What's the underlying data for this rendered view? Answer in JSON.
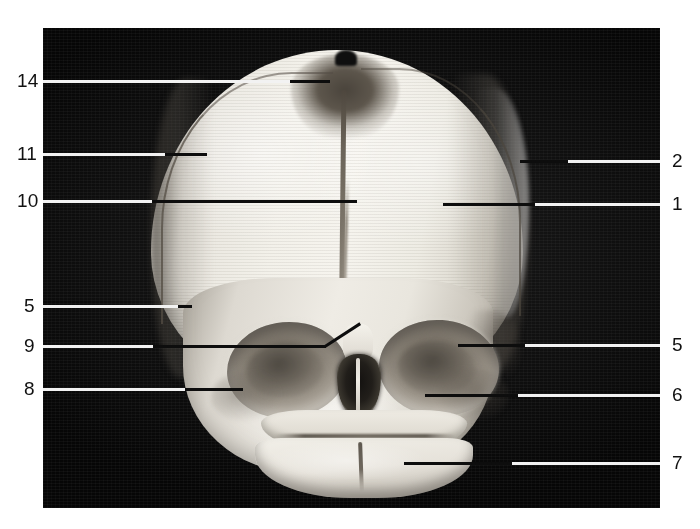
{
  "figure": {
    "plate_background_color": "#0a0a0a",
    "page_background_color": "#ffffff",
    "bone_color": "#f0ede6",
    "label_color": "#111111",
    "leader_line_dark_color": "#0d0d0d",
    "leader_line_light_color": "#f2f2f2"
  },
  "labels": {
    "left": [
      {
        "number": "14",
        "text_x": 17,
        "text_y": 71,
        "line_y": 80,
        "line_start_x": 43,
        "line_end_x": 330
      },
      {
        "number": "11",
        "text_x": 17,
        "text_y": 144,
        "line_y": 153,
        "line_start_x": 43,
        "line_end_x": 207
      },
      {
        "number": "10",
        "text_x": 17,
        "text_y": 191,
        "line_y": 200,
        "line_start_x": 43,
        "line_end_x": 357
      },
      {
        "number": "5",
        "text_x": 24,
        "text_y": 296,
        "line_y": 305,
        "line_start_x": 43,
        "line_end_x": 192
      },
      {
        "number": "9",
        "text_x": 24,
        "text_y": 336,
        "line_y": 345,
        "line_start_x": 43,
        "line_end_x": 326
      },
      {
        "number": "8",
        "text_x": 24,
        "text_y": 379,
        "line_y": 388,
        "line_start_x": 43,
        "line_end_x": 243
      }
    ],
    "right": [
      {
        "number": "2",
        "text_x": 672,
        "text_y": 151,
        "line_y": 160,
        "line_start_x": 520,
        "line_end_x": 660
      },
      {
        "number": "1",
        "text_x": 672,
        "text_y": 194,
        "line_y": 203,
        "line_start_x": 443,
        "line_end_x": 660
      },
      {
        "number": "5",
        "text_x": 672,
        "text_y": 335,
        "line_y": 344,
        "line_start_x": 458,
        "line_end_x": 660
      },
      {
        "number": "6",
        "text_x": 672,
        "text_y": 385,
        "line_y": 394,
        "line_start_x": 425,
        "line_end_x": 660
      },
      {
        "number": "7",
        "text_x": 672,
        "text_y": 453,
        "line_y": 462,
        "line_start_x": 404,
        "line_end_x": 660
      }
    ]
  },
  "leader_segments": {
    "l14_dark_start": 290,
    "l11_dark_start": 165,
    "l10_dark_start": 152,
    "l5_dark_start": 178,
    "l9_dark_start": 153,
    "l8_dark_start": 185,
    "l9_bend_x": 326,
    "l9_bend_end_x": 361,
    "l9_bend_end_y": 322,
    "r2_light_end": 568,
    "r1_dark_end": 535,
    "r5_dark_end": 525,
    "r6_dark_end": 518,
    "r7_dark_end": 512
  },
  "plate": {
    "x": 43,
    "y": 28,
    "width": 617,
    "height": 480
  }
}
